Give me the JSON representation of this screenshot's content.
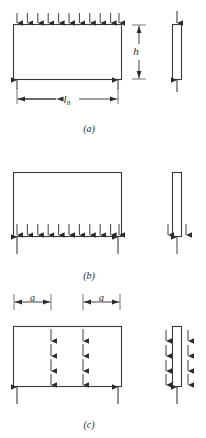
{
  "figure": {
    "title_visible": false,
    "stroke_color": "#3a3a3a",
    "fill_color": "#ffffff",
    "arrow_color": "#2b2b2b"
  },
  "panels": [
    {
      "key": "a",
      "caption": "(a)",
      "plan": {
        "load_edge": "top",
        "load_arrow_direction": "down",
        "load_arrow_count": 11,
        "reaction_arrow_direction": "up",
        "reaction_arrow_count": 2,
        "reaction_positions": [
          "left-corner",
          "right-corner"
        ]
      },
      "dimensions": [
        {
          "name": "span",
          "label": "l",
          "subscript": "n",
          "orientation": "horizontal",
          "placement": "below-plan"
        },
        {
          "name": "depth",
          "label": "h",
          "subscript": "",
          "orientation": "vertical",
          "placement": "right-of-plan"
        }
      ],
      "section": {
        "top_arrow_direction": "down",
        "top_arrow_count": 1,
        "bottom_arrow_direction": "up",
        "bottom_arrow_count": 1
      }
    },
    {
      "key": "b",
      "caption": "(b)",
      "plan": {
        "load_edge": "bottom-interior",
        "load_arrow_direction": "down",
        "load_arrow_count": 11,
        "reaction_arrow_direction": "up",
        "reaction_arrow_count": 2,
        "reaction_positions": [
          "left-corner",
          "right-corner"
        ]
      },
      "dimensions": [],
      "section": {
        "flank_arrow_direction": "down",
        "flank_arrow_count": 2,
        "bottom_arrow_direction": "up",
        "bottom_arrow_count": 1
      }
    },
    {
      "key": "c",
      "caption": "(c)",
      "plan": {
        "load_pattern": "two-interior-columns",
        "load_arrow_direction": "down",
        "columns": 2,
        "arrows_per_column": 4,
        "reaction_arrow_direction": "up",
        "reaction_arrow_count": 2,
        "reaction_positions": [
          "left-corner",
          "right-corner"
        ]
      },
      "dimensions": [
        {
          "name": "offset-left",
          "label": "a",
          "subscript": "",
          "orientation": "horizontal",
          "placement": "above-plan-left"
        },
        {
          "name": "offset-right",
          "label": "a",
          "subscript": "",
          "orientation": "horizontal",
          "placement": "above-plan-right"
        }
      ],
      "section": {
        "flank_arrow_direction": "down",
        "flank_columns": 2,
        "arrows_per_flank_column": 4,
        "bottom_arrow_direction": "up",
        "bottom_arrow_count": 1
      }
    }
  ],
  "labels": {
    "span_main": "l",
    "span_sub": "n",
    "depth": "h",
    "offset": "a",
    "caption_a": "(a)",
    "caption_b": "(b)",
    "caption_c": "(c)"
  }
}
